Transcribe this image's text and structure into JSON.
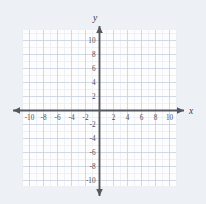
{
  "figure": {
    "name": "blank-cartesian-coordinate-grid",
    "background_color": "#edf0f5",
    "plot_background_color": "#fdfdfe"
  },
  "chart_data": {
    "type": "scatter",
    "title": "",
    "subtitle": "",
    "xlabel": "x",
    "ylabel": "y",
    "xlim": [
      -11,
      11
    ],
    "ylim": [
      -11,
      11
    ],
    "x_tick_labels": [
      "-10",
      "-8",
      "-6",
      "-4",
      "-2",
      "2",
      "4",
      "6",
      "8",
      "10"
    ],
    "y_tick_labels": [
      "10",
      "8",
      "6",
      "4",
      "2",
      "-2",
      "-4",
      "-6",
      "-8",
      "-10"
    ],
    "x_ticks": [
      -10,
      -8,
      -6,
      -4,
      -2,
      2,
      4,
      6,
      8,
      10
    ],
    "y_ticks": [
      10,
      8,
      6,
      4,
      2,
      -2,
      -4,
      -6,
      -8,
      -10
    ],
    "major_tick_interval": 2,
    "minor_tick_interval": 1,
    "grid": true,
    "grid_minor": true,
    "legend": false,
    "legend_position": "none",
    "series": [],
    "annotations": [],
    "origin_label": "",
    "colors": {
      "axis": "#55595f",
      "major_grid": "#c3ccdd",
      "minor_grid": "#e6ebf3",
      "tick_text": "#4a4f57",
      "axis_name_text": "#3a3f46",
      "plot_fill": "#fdfdfe",
      "page_background": "#edf0f5"
    }
  },
  "axes": {
    "x_axis_name": "x",
    "y_axis_name": "y",
    "x_axis_arrows": [
      "left",
      "right"
    ],
    "y_axis_arrows": [
      "up",
      "down"
    ]
  },
  "geometry": {
    "origin_px": {
      "x": 99.5,
      "y": 110.5
    },
    "unit_px": 7.0,
    "grid_left_px": 23,
    "grid_right_px": 176,
    "grid_top_px": 30,
    "grid_bottom_px": 186
  }
}
